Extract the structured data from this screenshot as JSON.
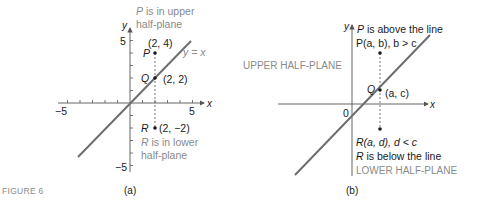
{
  "figure_label": "FIGURE 6",
  "colors": {
    "line": "#6e6e6e",
    "axis": "#555555",
    "text_dark": "#1a1a1a",
    "text_gray": "#8a8a8a"
  },
  "panel_a": {
    "caption": "(a)",
    "x_axis_label": "x",
    "y_axis_label": "y",
    "tick_labels": {
      "x_neg": "−5",
      "x_pos": "5",
      "y_pos": "5",
      "y_neg": "−5"
    },
    "line_label": "y = x",
    "points": {
      "P": {
        "name": "P",
        "coords": "(2, 4)"
      },
      "Q": {
        "name": "Q",
        "coords": "(2, 2)"
      },
      "R": {
        "name": "R",
        "coords": "(2, −2)"
      }
    },
    "notes": {
      "upper_line1_italic": "P",
      "upper_line1_rest": " is in upper",
      "upper_line2": "half-plane",
      "lower_line1_italic": "R",
      "lower_line1_rest": " is in lower",
      "lower_line2": "half-plane"
    }
  },
  "panel_b": {
    "caption": "(b)",
    "x_axis_label": "x",
    "y_axis_label": "y",
    "origin_label": "0",
    "upper_region": "UPPER HALF-PLANE",
    "lower_region": "LOWER HALF-PLANE",
    "p_note_italic": "P",
    "p_note_rest": " is above the line",
    "p_label": "P(a, b), b > c",
    "q_label": "Q",
    "q_coords": "(a, c)",
    "r_label": "R(a, d), d < c",
    "r_note_italic": "R",
    "r_note_rest": " is below the line"
  }
}
